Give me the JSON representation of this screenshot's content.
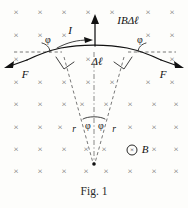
{
  "figure": {
    "caption": "Fig. 1",
    "field_marker": "×",
    "field_label": "B",
    "field_symbol": "⊗",
    "force_label_left": "F",
    "force_label_right": "F",
    "current_label": "I",
    "resultant_label": "IBΔℓ",
    "segment_label": "Δℓ",
    "angle_label_upper_left": "φ",
    "angle_label_upper_right": "φ",
    "angle_label_apex_left": "φ",
    "angle_label_apex_right": "φ",
    "radius_label_left": "r",
    "radius_label_right": "r",
    "colors": {
      "ink": "#111111",
      "field_mark": "#6e6e6e",
      "dashed": "#555555",
      "background": "#fdfdfb"
    },
    "field_grid": {
      "columns_x": [
        16,
        40,
        64,
        93,
        108,
        124,
        148,
        172
      ],
      "rows_y": [
        13,
        36,
        60,
        83,
        105,
        128,
        150,
        172
      ]
    }
  }
}
